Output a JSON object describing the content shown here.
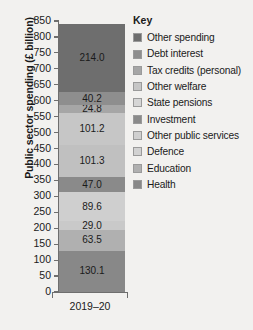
{
  "chart_data": {
    "type": "bar",
    "subtype": "stacked-bar-single-category",
    "title": "",
    "xlabel": "",
    "ylabel": "Public sector spending (£ billion)",
    "categories": [
      "2019–20"
    ],
    "ylim": [
      0,
      850
    ],
    "y_ticks": [
      0,
      50,
      100,
      150,
      200,
      250,
      300,
      350,
      400,
      450,
      500,
      550,
      600,
      650,
      700,
      750,
      800,
      850
    ],
    "y_tick_labels": [
      "0",
      "50",
      "100",
      "150",
      "200",
      "250",
      "300",
      "350",
      "400",
      "450",
      "500",
      "550",
      "600",
      "650",
      "700",
      "750",
      "800",
      "850"
    ],
    "grid": false,
    "legend_position": "right",
    "legend_title": "Key",
    "total": 840.7,
    "stack_order_bottom_to_top": [
      "Health",
      "Education",
      "Defence",
      "Other public services",
      "Investment",
      "State pensions",
      "Other welfare",
      "Tax credits (personal)",
      "Debt interest",
      "Other spending"
    ],
    "series": [
      {
        "name": "Other spending",
        "value": 214.0,
        "label": "214.0",
        "color": "#6e6e6e",
        "show_label": true
      },
      {
        "name": "Debt interest",
        "value": 40.2,
        "label": "40.2",
        "color": "#8e8e8e",
        "show_label": true
      },
      {
        "name": "Tax credits (personal)",
        "value": 24.8,
        "label": "24.8",
        "color": "#a6a6a6",
        "show_label": true
      },
      {
        "name": "Other welfare",
        "value": 101.2,
        "label": "101.2",
        "color": "#c6c6c6",
        "show_label": true
      },
      {
        "name": "State pensions",
        "value": 101.3,
        "label": "101.3",
        "color": "#c0c0c0",
        "show_label": true
      },
      {
        "name": "Investment",
        "value": 47.0,
        "label": "47.0",
        "color": "#8a8a8a",
        "show_label": true
      },
      {
        "name": "Other public services",
        "value": 89.6,
        "label": "89.6",
        "color": "#cfcfcf",
        "show_label": true
      },
      {
        "name": "Defence",
        "value": 29.0,
        "label": "29.0",
        "color": "#c9c9c9",
        "show_label": true
      },
      {
        "name": "Education",
        "value": 63.5,
        "label": "63.5",
        "color": "#b0b0b0",
        "show_label": true
      },
      {
        "name": "Health",
        "value": 130.1,
        "label": "130.1",
        "color": "#888888",
        "show_label": true
      }
    ]
  },
  "legend": {
    "title": "Key",
    "items": [
      {
        "label": "Other spending",
        "color": "#6e6e6e"
      },
      {
        "label": "Debt interest",
        "color": "#8e8e8e"
      },
      {
        "label": "Tax credits (personal)",
        "color": "#a6a6a6"
      },
      {
        "label": "Other welfare",
        "color": "#c6c6c6"
      },
      {
        "label": "State pensions",
        "color": "#d6d6d6"
      },
      {
        "label": "Investment",
        "color": "#8a8a8a"
      },
      {
        "label": "Other public services",
        "color": "#cfcfcf"
      },
      {
        "label": "Defence",
        "color": "#d2d2d2"
      },
      {
        "label": "Education",
        "color": "#b0b0b0"
      },
      {
        "label": "Health",
        "color": "#888888"
      }
    ]
  },
  "axes": {
    "y_title": "Public sector spending (£ billion)",
    "x_category": "2019–20"
  },
  "colors": {
    "background": "#f2f1ef",
    "axis": "#6e6e6e",
    "text": "#1a1a1a"
  }
}
